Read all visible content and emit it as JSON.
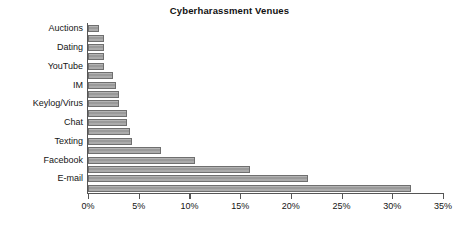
{
  "chart_data": {
    "type": "bar",
    "orientation": "horizontal",
    "title": "Cyberharassment Venues",
    "xlabel": "",
    "ylabel": "",
    "xlim": [
      0,
      35
    ],
    "xtick_labels": [
      "0%",
      "5%",
      "10%",
      "15%",
      "20%",
      "25%",
      "30%",
      "35%"
    ],
    "xticks": [
      0,
      5,
      10,
      15,
      20,
      25,
      30,
      35
    ],
    "grid": false,
    "legend": false,
    "value_unit": "%",
    "categories": [
      "Auctions",
      "",
      "Dating",
      "",
      "YouTube",
      "",
      "IM",
      "",
      "Keylog/Virus",
      "",
      "Chat",
      "",
      "Texting",
      "",
      "Facebook",
      "",
      "E-mail",
      ""
    ],
    "labeled_categories": [
      "Auctions",
      "Dating",
      "YouTube",
      "IM",
      "Keylog/Virus",
      "Chat",
      "Texting",
      "Facebook",
      "E-mail"
    ],
    "values": [
      1.1,
      1.6,
      1.6,
      1.6,
      1.6,
      2.5,
      2.8,
      3.1,
      3.1,
      3.8,
      3.8,
      4.1,
      4.3,
      7.2,
      10.5,
      16.0,
      21.7,
      31.8
    ],
    "bar_color": "#a3a3a3",
    "bar_edge_color": "#6f6f6f",
    "axis_color": "#555555",
    "background_color": "#ffffff"
  }
}
